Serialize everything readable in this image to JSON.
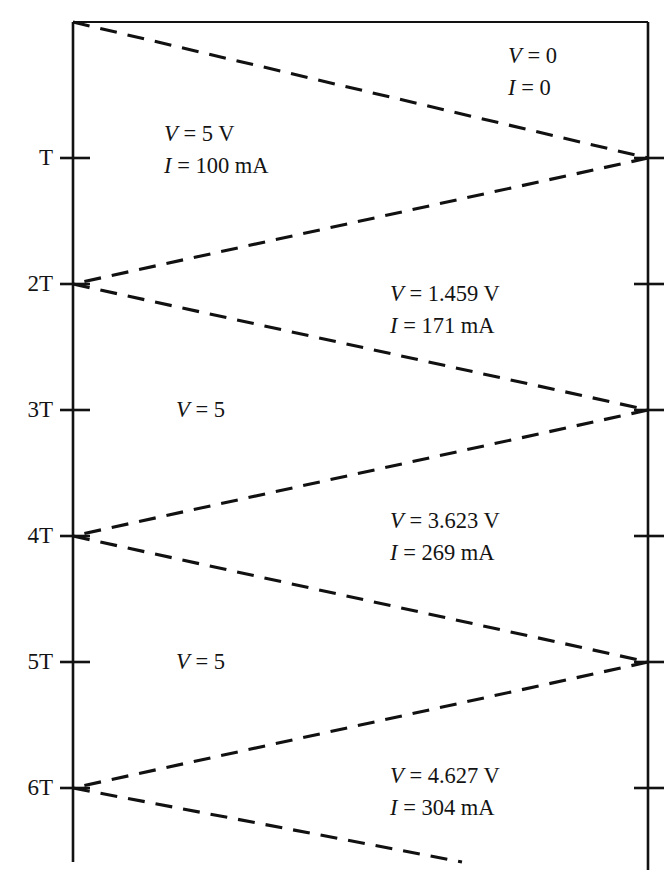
{
  "figure": {
    "kind": "bounce-diagram"
  },
  "axes": {
    "left_axis_name": "source-end-time-axis",
    "right_axis_name": "load-end-time-axis",
    "tick_labels": [
      "T",
      "2T",
      "3T",
      "4T",
      "5T",
      "6T"
    ]
  },
  "annotations": [
    {
      "id": "a0",
      "voltage": "V = 0",
      "current": "I = 0"
    },
    {
      "id": "a1",
      "voltage": "V = 5 V",
      "current": "I = 100 mA"
    },
    {
      "id": "a2",
      "voltage": "V = 1.459 V",
      "current": "I = 171 mA"
    },
    {
      "id": "a3",
      "voltage": "V = 5",
      "current": ""
    },
    {
      "id": "a4",
      "voltage": "V = 3.623 V",
      "current": "I = 269 mA"
    },
    {
      "id": "a5",
      "voltage": "V = 5",
      "current": ""
    },
    {
      "id": "a6",
      "voltage": "V = 4.627 V",
      "current": "I = 304 mA"
    }
  ],
  "chart_data": {
    "type": "line",
    "title": "",
    "xlabel": "",
    "ylabel": "",
    "grid": false,
    "legend": "none",
    "axis_x": {
      "left_position_px": 73,
      "right_position_px": 648
    },
    "axis_y": {
      "top_px": 22,
      "bottom_px": 862,
      "period_px": 126
    },
    "tick_times": [
      "T",
      "2T",
      "3T",
      "4T",
      "5T",
      "6T"
    ],
    "left_tick_y_px": [
      158,
      284,
      410,
      536,
      662,
      788
    ],
    "right_tick_y_px": [
      158,
      284,
      410,
      536,
      662,
      788
    ],
    "series": [
      {
        "name": "incident-0-to-T",
        "points": [
          [
            73,
            22
          ],
          [
            648,
            158
          ]
        ]
      },
      {
        "name": "reflected-T-to-2T",
        "points": [
          [
            648,
            158
          ],
          [
            73,
            284
          ]
        ]
      },
      {
        "name": "incident-2T-to-3T",
        "points": [
          [
            73,
            284
          ],
          [
            648,
            410
          ]
        ]
      },
      {
        "name": "reflected-3T-to-4T",
        "points": [
          [
            648,
            410
          ],
          [
            73,
            536
          ]
        ]
      },
      {
        "name": "incident-4T-to-5T",
        "points": [
          [
            73,
            536
          ],
          [
            648,
            662
          ]
        ]
      },
      {
        "name": "reflected-5T-to-6T",
        "points": [
          [
            648,
            662
          ],
          [
            73,
            788
          ]
        ]
      },
      {
        "name": "incident-6T-onward",
        "points": [
          [
            73,
            788
          ],
          [
            462,
            862
          ]
        ]
      }
    ],
    "region_values": [
      {
        "label": "V = 0",
        "sublabel": "I = 0",
        "x_px": 540,
        "y_px": 52
      },
      {
        "label": "V = 5 V",
        "sublabel": "I = 100 mA",
        "x_px": 235,
        "y_px": 130
      },
      {
        "label": "V = 1.459 V",
        "sublabel": "I = 171 mA",
        "x_px": 455,
        "y_px": 291
      },
      {
        "label": "V = 5",
        "sublabel": "",
        "x_px": 225,
        "y_px": 405
      },
      {
        "label": "V = 3.623 V",
        "sublabel": "I = 269 mA",
        "x_px": 455,
        "y_px": 518
      },
      {
        "label": "V = 5",
        "sublabel": "",
        "x_px": 225,
        "y_px": 657
      },
      {
        "label": "V = 4.627 V",
        "sublabel": "I = 304 mA",
        "x_px": 455,
        "y_px": 772
      }
    ]
  },
  "style": {
    "stroke_color": "#121212",
    "background": "#ffffff"
  }
}
